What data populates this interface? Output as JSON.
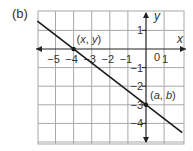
{
  "figure": {
    "part_label": "(b)",
    "axes": {
      "x_name": "x",
      "y_name": "y",
      "x_ticks": [
        {
          "value": -5,
          "label": "−5"
        },
        {
          "value": -4,
          "label": "−4"
        },
        {
          "value": -3,
          "label": "−3"
        },
        {
          "value": -2,
          "label": "−2"
        },
        {
          "value": -1,
          "label": "−1"
        },
        {
          "value": 1,
          "label": "1"
        }
      ],
      "origin_label": "0",
      "y_ticks": [
        {
          "value": 1,
          "label": "1"
        },
        {
          "value": -1,
          "label": "−1"
        },
        {
          "value": -2,
          "label": "−2"
        },
        {
          "value": -3,
          "label": "−3"
        },
        {
          "value": -4,
          "label": "−4"
        }
      ]
    },
    "points": [
      {
        "x": -4,
        "y": 0,
        "label_pre": "(",
        "var1": "x",
        "sep": ", ",
        "var2": "y",
        "label_post": ")"
      },
      {
        "x": 0,
        "y": -3,
        "label_pre": "(",
        "var1": "a",
        "sep": ", ",
        "var2": "b",
        "label_post": ")"
      }
    ],
    "line": {
      "through": [
        [
          -4,
          0
        ],
        [
          0,
          -3
        ]
      ],
      "slope": -0.75,
      "intercept": -3
    }
  },
  "chart_data": {
    "type": "line",
    "title": "(b)",
    "xlabel": "x",
    "ylabel": "y",
    "xlim": [
      -6,
      2
    ],
    "ylim": [
      -5.2,
      2
    ],
    "grid": true,
    "series": [
      {
        "name": "line",
        "x": [
          -6,
          2
        ],
        "y": [
          1.5,
          -4.5
        ]
      }
    ],
    "annotations": [
      {
        "text": "(x, y)",
        "x": -4,
        "y": 0
      },
      {
        "text": "(a, b)",
        "x": 0,
        "y": -3
      }
    ]
  },
  "colors": {
    "grid": "#a8a8a8",
    "axis": "#222222",
    "line": "#1a1a1a",
    "text": "#333333"
  }
}
